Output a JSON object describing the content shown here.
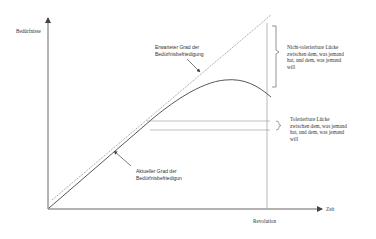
{
  "diagram": {
    "y_axis_label": "Bedürfnisse",
    "x_axis_label": "Zeit",
    "x_marker_label": "Revolution",
    "expected_label": "Erwarteter Grad der\nBedürfnisbefriedigung",
    "actual_label": "Aktueller Grad der\nBedürfnisbefriedigun",
    "intolerable_gap_label": "Nicht-tolerierbare Lücke\nzwischen dem, was jemand\nhat, und dem, was jemand\nwill",
    "tolerable_gap_label": "Tolerierbare Lücke\nzwischen dem, was jemand\nhat, und dem, was jemand\nwill",
    "colors": {
      "axis": "#555555",
      "expected_line": "#777777",
      "actual_curve": "#444444",
      "guide_lines": "#999999"
    }
  }
}
